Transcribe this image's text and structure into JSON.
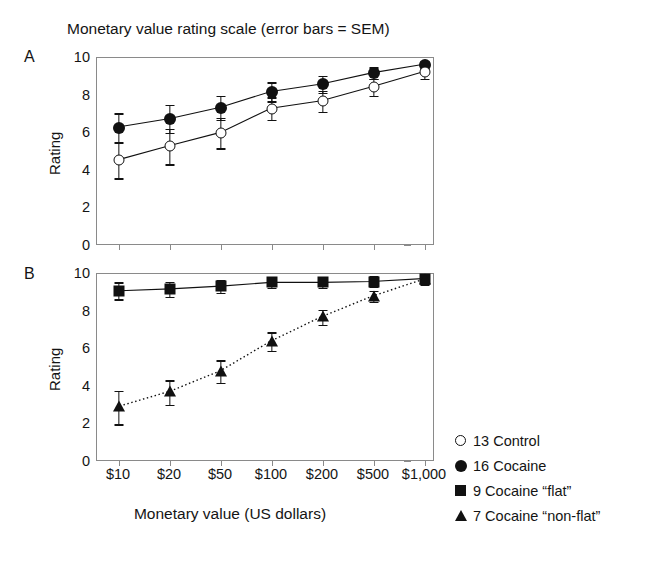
{
  "figure": {
    "title": "Monetary value rating scale (error bars = SEM)",
    "xlabel": "Monetary value (US dollars)",
    "ylabel": "Rating",
    "panel_a_letter": "A",
    "panel_b_letter": "B"
  },
  "legend": {
    "items": [
      {
        "marker": "circle-open",
        "label": "13 Control"
      },
      {
        "marker": "circle-filled",
        "label": "16 Cocaine"
      },
      {
        "marker": "square-filled",
        "label": "9 Cocaine “flat”"
      },
      {
        "marker": "triangle-filled",
        "label": "7 Cocaine “non-flat”"
      }
    ]
  },
  "chart_data": [
    {
      "type": "line",
      "panel": "A",
      "title": "Monetary value rating scale (error bars = SEM)",
      "xlabel": "Monetary value (US dollars)",
      "ylabel": "Rating",
      "categories": [
        "$10",
        "$20",
        "$50",
        "$100",
        "$200",
        "$500",
        "$1,000"
      ],
      "ylim": [
        0,
        10
      ],
      "yticks": [
        0,
        2,
        4,
        6,
        8,
        10
      ],
      "grid": false,
      "legend_position": "outside-right-bottom",
      "series": [
        {
          "name": "16 Cocaine",
          "marker": "circle-filled",
          "linestyle": "solid",
          "values": [
            6.3,
            6.75,
            7.35,
            8.2,
            8.6,
            9.2,
            9.65
          ],
          "errors": [
            0.75,
            0.75,
            0.65,
            0.5,
            0.45,
            0.3,
            0.2
          ]
        },
        {
          "name": "13 Control",
          "marker": "circle-open",
          "linestyle": "solid",
          "values": [
            4.55,
            5.3,
            6.0,
            7.3,
            7.7,
            8.45,
            9.25
          ],
          "errors": [
            0.95,
            0.95,
            0.8,
            0.6,
            0.55,
            0.45,
            0.35
          ]
        }
      ]
    },
    {
      "type": "line",
      "panel": "B",
      "xlabel": "Monetary value (US dollars)",
      "ylabel": "Rating",
      "categories": [
        "$10",
        "$20",
        "$50",
        "$100",
        "$200",
        "$500",
        "$1,000"
      ],
      "ylim": [
        0,
        10
      ],
      "yticks": [
        0,
        2,
        4,
        6,
        8,
        10
      ],
      "grid": false,
      "series": [
        {
          "name": "9 Cocaine “flat”",
          "marker": "square-filled",
          "linestyle": "solid",
          "values": [
            9.1,
            9.2,
            9.35,
            9.55,
            9.55,
            9.6,
            9.75
          ],
          "errors": [
            0.45,
            0.4,
            0.35,
            0.3,
            0.3,
            0.3,
            0.25
          ]
        },
        {
          "name": "7 Cocaine “non-flat”",
          "marker": "triangle-filled",
          "linestyle": "dotted",
          "values": [
            2.9,
            3.7,
            4.8,
            6.4,
            7.7,
            8.8,
            9.7
          ],
          "errors": [
            0.9,
            0.65,
            0.6,
            0.5,
            0.4,
            0.3,
            0.25
          ]
        }
      ]
    }
  ]
}
